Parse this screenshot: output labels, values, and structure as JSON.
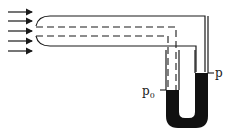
{
  "diagram": {
    "flow_arrows": {
      "count": 5,
      "direction": "right"
    },
    "labels": {
      "p0_main": "p",
      "p0_sub": "0",
      "p": "p"
    },
    "colors": {
      "line": "#1a1a1a",
      "fluid": "#111111",
      "background": "#ffffff"
    }
  }
}
